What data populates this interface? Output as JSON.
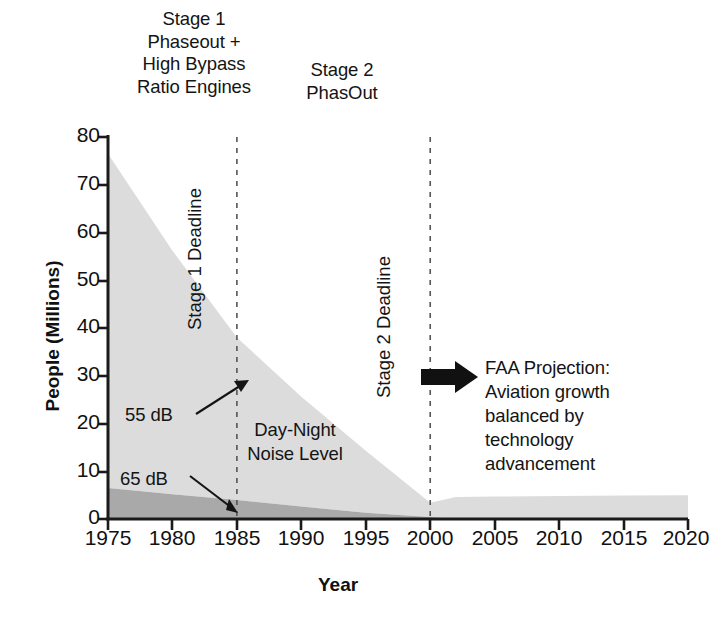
{
  "chart_data": {
    "type": "area",
    "title": "",
    "xlabel": "Year",
    "ylabel": "People (Millions)",
    "xlim": [
      1975,
      2020
    ],
    "ylim": [
      0,
      80
    ],
    "xticks": [
      1975,
      1980,
      1985,
      1990,
      1995,
      2000,
      2005,
      2010,
      2015,
      2020
    ],
    "yticks": [
      0,
      10,
      20,
      30,
      40,
      50,
      60,
      70,
      80
    ],
    "grid": false,
    "legend_position": "in-plot-annotations",
    "stacked": true,
    "x": [
      1975,
      1980,
      1985,
      1990,
      1995,
      2000,
      2002,
      2005,
      2010,
      2015,
      2020
    ],
    "series": [
      {
        "name": "55 dB",
        "color": "#dcdcdc",
        "values": [
          70,
          51,
          34,
          23,
          13,
          3,
          4.6,
          4.7,
          4.8,
          4.9,
          5.0
        ]
      },
      {
        "name": "65 dB",
        "color": "#a9a9a9",
        "values": [
          6.5,
          5.2,
          4.0,
          2.6,
          1.3,
          0.4,
          0,
          0,
          0,
          0,
          0
        ]
      }
    ],
    "annotations": [
      {
        "text": "Stage 1 Deadline",
        "x": 1985,
        "type": "vline",
        "style": "dashed"
      },
      {
        "text": "Stage 2 Deadline",
        "x": 2000,
        "type": "vline",
        "style": "dashed"
      },
      {
        "text": "55 dB",
        "x": 1979,
        "y": 26
      },
      {
        "text": "65 dB",
        "x": 1979,
        "y": 11
      },
      {
        "text": "Day-Night\nNoise Level",
        "x": 1990,
        "y": 20
      }
    ]
  },
  "headings": {
    "stage1": "Stage 1\nPhaseout +\nHigh Bypass\nRatio Engines",
    "stage2": "Stage 2\nPhasOut"
  },
  "deadlines": {
    "stage1": "Stage 1 Deadline",
    "stage2": "Stage 2 Deadline"
  },
  "plot_labels": {
    "db55": "55 dB",
    "db65": "65 dB",
    "day_night": "Day-Night\nNoise Level"
  },
  "callout": {
    "text": "FAA Projection:\nAviation growth\nbalanced by\ntechnology\nadvancement",
    "arrow": "right-arrow-icon"
  },
  "axes": {
    "y_title": "People (Millions)",
    "x_title": "Year",
    "y_ticks": [
      "0",
      "10",
      "20",
      "30",
      "40",
      "50",
      "60",
      "70",
      "80"
    ],
    "x_ticks": [
      "1975",
      "1980",
      "1985",
      "1990",
      "1995",
      "2000",
      "2005",
      "2010",
      "2015",
      "2020"
    ]
  },
  "colors": {
    "band_55db": "#dcdcdc",
    "band_65db": "#a9a9a9",
    "axis": "#1a1a1a",
    "text": "#141414"
  }
}
